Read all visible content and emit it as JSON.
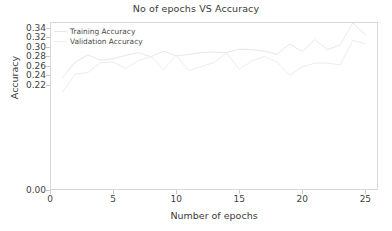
{
  "chart_data": {
    "type": "line",
    "title": "No of epochs VS Accuracy",
    "xlabel": "Number of epochs",
    "ylabel": "Accuracy",
    "xlim": [
      0,
      26
    ],
    "ylim": [
      0.0,
      0.352
    ],
    "grid": false,
    "legend_position": "upper left",
    "xticks": [
      0,
      5,
      10,
      15,
      20,
      25
    ],
    "xtick_labels": [
      "0",
      "5",
      "10",
      "15",
      "20",
      "25"
    ],
    "yticks": [
      0.0,
      0.22,
      0.24,
      0.26,
      0.28,
      0.3,
      0.32,
      0.34
    ],
    "ytick_labels": [
      "0.00",
      "0.22",
      "0.24",
      "0.26",
      "0.28",
      "0.30",
      "0.32",
      "0.34"
    ],
    "x": [
      1,
      2,
      3,
      4,
      5,
      6,
      7,
      8,
      9,
      10,
      11,
      12,
      13,
      14,
      15,
      16,
      17,
      18,
      19,
      20,
      21,
      22,
      23,
      24,
      25
    ],
    "series": [
      {
        "name": "Training Accuracy",
        "color": "#e8e8e8",
        "values": [
          0.236,
          0.268,
          0.283,
          0.272,
          0.275,
          0.282,
          0.288,
          0.279,
          0.291,
          0.281,
          0.284,
          0.288,
          0.289,
          0.288,
          0.295,
          0.294,
          0.291,
          0.284,
          0.306,
          0.29,
          0.315,
          0.294,
          0.304,
          0.35,
          0.325
        ]
      },
      {
        "name": "Validation Accuracy",
        "color": "#ededed",
        "values": [
          0.205,
          0.243,
          0.246,
          0.267,
          0.268,
          0.255,
          0.271,
          0.28,
          0.252,
          0.283,
          0.25,
          0.259,
          0.267,
          0.287,
          0.253,
          0.27,
          0.28,
          0.268,
          0.24,
          0.258,
          0.266,
          0.266,
          0.262,
          0.314,
          0.306
        ]
      }
    ]
  },
  "legend": {
    "items": [
      {
        "label": "Training Accuracy"
      },
      {
        "label": "Validation Accuracy"
      }
    ]
  }
}
